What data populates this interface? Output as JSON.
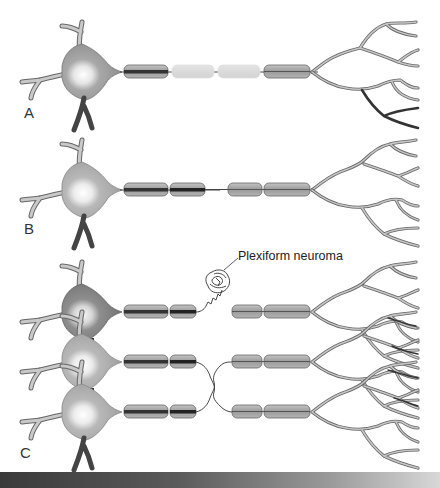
{
  "figure": {
    "colors": {
      "soma": "#9a9a9a",
      "soma_dark": "#7a7a7a",
      "nucleus_highlight": "#f4f4f4",
      "myelin": "#a8a8a8",
      "myelin_degenerating": "#d9d9d9",
      "axon": "#2e2e2e",
      "dendrite_fill": "#bdbdbd",
      "dendrite_stroke": "#555555"
    },
    "panels": [
      {
        "id": "A",
        "label": "A",
        "description": "Intact neuron with Wallerian degeneration of distal segment (pale myelin)"
      },
      {
        "id": "B",
        "label": "B",
        "description": "Axon transected with gap between proximal and distal segments"
      },
      {
        "id": "C",
        "label": "C",
        "description": "Misdirected regeneration; proximal stumps cross and form neuroma"
      }
    ],
    "annotations": [
      {
        "text": "Plexiform neuroma",
        "target": "neuroma-tangle"
      }
    ]
  }
}
